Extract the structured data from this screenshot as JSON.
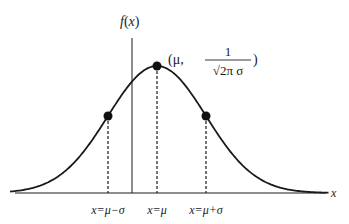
{
  "diagram": {
    "y_axis_label": "f(x)",
    "x_axis_label": "x",
    "peak_label": {
      "prefix": "(μ,",
      "numerator": "1",
      "denominator": "√2π σ",
      "suffix": ")"
    },
    "tick_labels": [
      "x=μ−σ",
      "x=μ",
      "x=μ+σ"
    ],
    "points": [
      {
        "name": "inflection-left",
        "x_in_sigma": -1
      },
      {
        "name": "peak",
        "x_in_sigma": 0
      },
      {
        "name": "inflection-right",
        "x_in_sigma": 1
      }
    ],
    "curve": {
      "type": "gaussian",
      "mu": 0,
      "sigma": 1,
      "x_range_sigma": [
        -3.0,
        3.5
      ]
    },
    "colors": {
      "stroke": "#1a1a1a",
      "text": "#222222"
    }
  }
}
